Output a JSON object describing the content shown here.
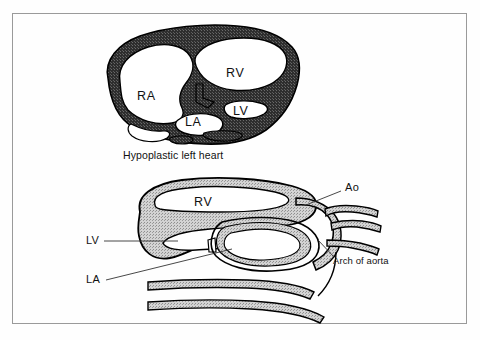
{
  "figure": {
    "type": "medical-illustration",
    "caption": "Hypoplastic left heart",
    "frame": {
      "border_color": "#9a9a9a",
      "background_color": "#ffffff"
    },
    "palette": {
      "page_background": "#ffffff",
      "outline": "#000000",
      "upper_wall_fill": "#3c3c3c",
      "lower_wall_fill": "#b9b9b9",
      "chamber_lumen": "#ffffff",
      "label_text": "#111111",
      "leader_line": "#333333"
    },
    "upper_panel": {
      "name": "four-chamber-view",
      "description": "Four chamber cross-section with thick dark stippled myocardium",
      "labels": [
        {
          "key": "ra",
          "text": "RA",
          "x": 137,
          "y": 97,
          "meaning": "right atrium"
        },
        {
          "key": "rv",
          "text": "RV",
          "x": 226,
          "y": 74,
          "meaning": "right ventricle"
        },
        {
          "key": "la",
          "text": "LA",
          "x": 193,
          "y": 123,
          "meaning": "left atrium"
        },
        {
          "key": "lv",
          "text": "LV",
          "x": 240,
          "y": 112,
          "meaning": "left ventricle"
        }
      ],
      "caption": {
        "text": "Hypoplastic left heart",
        "x": 123,
        "y": 156
      }
    },
    "lower_panel": {
      "name": "aortic-arch-view",
      "description": "Sagittal section showing right ventricle, hypoplastic left heart structures and the aortic arch with its branch vessels",
      "labels": [
        {
          "key": "rv",
          "text": "RV",
          "x": 197,
          "y": 203,
          "meaning": "right ventricle",
          "leader": false
        },
        {
          "key": "lv",
          "text": "LV",
          "x": 88,
          "y": 237,
          "meaning": "left ventricle",
          "leader": true
        },
        {
          "key": "la",
          "text": "LA",
          "x": 88,
          "y": 277,
          "meaning": "left atrium",
          "leader": true
        },
        {
          "key": "ao",
          "text": "Ao",
          "x": 345,
          "y": 188,
          "meaning": "aorta",
          "leader": true
        },
        {
          "key": "arch",
          "text": "Arch of aorta",
          "x": 333,
          "y": 261,
          "meaning": "arch of aorta",
          "leader": true
        }
      ]
    }
  }
}
